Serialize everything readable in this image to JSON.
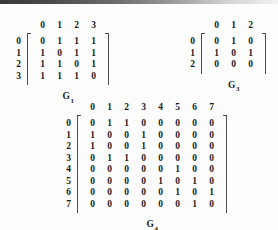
{
  "document": {
    "type": "adjacency-matrix-figure",
    "background_color": "#fdfdfd",
    "ink_color": "#1a1a1a"
  },
  "matrices": [
    {
      "id": "g1",
      "caption_base": "G",
      "caption_sub": "1",
      "size": 4,
      "col_headers": [
        "0",
        "1",
        "2",
        "3"
      ],
      "row_headers": [
        "0",
        "1",
        "2",
        "3"
      ],
      "rows": [
        [
          "0",
          "1",
          "1",
          "1"
        ],
        [
          "1",
          "0",
          "1",
          "1"
        ],
        [
          "1",
          "1",
          "0",
          "1"
        ],
        [
          "1",
          "1",
          "1",
          "0"
        ]
      ]
    },
    {
      "id": "g3",
      "caption_base": "G",
      "caption_sub": "3",
      "size": 3,
      "col_headers": [
        "0",
        "1",
        "2"
      ],
      "row_headers": [
        "0",
        "1",
        "2"
      ],
      "rows": [
        [
          "0",
          "1",
          "0"
        ],
        [
          "1",
          "0",
          "1"
        ],
        [
          "0",
          "0",
          "0"
        ]
      ]
    },
    {
      "id": "g4",
      "caption_base": "G",
      "caption_sub": "4",
      "size": 8,
      "col_headers": [
        "0",
        "1",
        "2",
        "3",
        "4",
        "5",
        "6",
        "7"
      ],
      "row_headers": [
        "0",
        "1",
        "2",
        "3",
        "4",
        "5",
        "6",
        "7"
      ],
      "rows": [
        [
          "0",
          "1",
          "1",
          "0",
          "0",
          "0",
          "0",
          "0"
        ],
        [
          "1",
          "0",
          "0",
          "1",
          "0",
          "0",
          "0",
          "0"
        ],
        [
          "1",
          "0",
          "0",
          "1",
          "0",
          "0",
          "0",
          "0"
        ],
        [
          "0",
          "1",
          "1",
          "0",
          "0",
          "0",
          "0",
          "0"
        ],
        [
          "0",
          "0",
          "0",
          "0",
          "0",
          "1",
          "0",
          "0"
        ],
        [
          "0",
          "0",
          "0",
          "0",
          "1",
          "0",
          "1",
          "0"
        ],
        [
          "0",
          "0",
          "0",
          "0",
          "0",
          "1",
          "0",
          "1"
        ],
        [
          "0",
          "0",
          "0",
          "0",
          "0",
          "0",
          "1",
          "0"
        ]
      ]
    }
  ]
}
